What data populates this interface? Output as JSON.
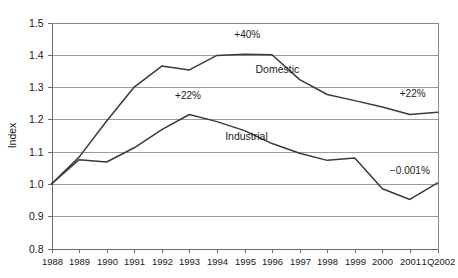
{
  "chart_data": {
    "type": "line",
    "title": "",
    "subtitle": "",
    "xlabel": "",
    "ylabel": "Index",
    "grid": true,
    "legend_position": "inline-labels",
    "categories": [
      "1988",
      "1989",
      "1990",
      "1991",
      "1992",
      "1993",
      "1994",
      "1995",
      "1996",
      "1997",
      "1998",
      "1999",
      "2000",
      "2001",
      "1Q2002"
    ],
    "ylim": [
      0.8,
      1.5
    ],
    "ytick_labels": [
      "1.5",
      "1.4",
      "1.3",
      "1.2",
      "1.1",
      "1.0",
      "0.9",
      "0.8"
    ],
    "ytick_values": [
      1.5,
      1.4,
      1.3,
      1.2,
      1.1,
      1.0,
      0.9,
      0.8
    ],
    "series": [
      {
        "name": "Domestic",
        "values": [
          1.0,
          1.083,
          1.195,
          1.3,
          1.365,
          1.353,
          1.398,
          1.402,
          1.4,
          1.323,
          1.277,
          1.258,
          1.238,
          1.215,
          1.222
        ],
        "label_text": "Domestic",
        "label_x_index": 7.4,
        "label_y_value": 1.345,
        "annotations": [
          {
            "text": "+40%",
            "x_index": 7.1,
            "y_value": 1.452
          },
          {
            "text": "+22%",
            "x_index": 13.1,
            "y_value": 1.268
          }
        ]
      },
      {
        "name": "Industrial",
        "values": [
          1.0,
          1.075,
          1.068,
          1.112,
          1.168,
          1.215,
          1.193,
          1.165,
          1.125,
          1.095,
          1.073,
          1.08,
          0.985,
          0.952,
          1.003
        ],
        "label_text": "Industrial",
        "label_x_index": 6.3,
        "label_y_value": 1.135,
        "annotations": [
          {
            "text": "+22%",
            "x_index": 4.95,
            "y_value": 1.262
          },
          {
            "text": "−0.001%",
            "x_index": 13.0,
            "y_value": 1.032
          }
        ]
      }
    ]
  },
  "colors": {
    "line": "#3a3a3a",
    "grid": "#9a9a9a",
    "axis": "#6a6a6a",
    "text": "#1a1a1a",
    "background": "#ffffff"
  }
}
